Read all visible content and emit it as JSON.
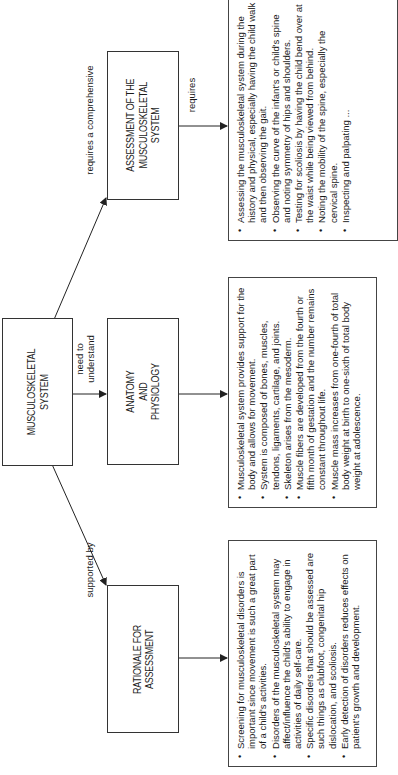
{
  "diagram": {
    "type": "concept-map",
    "orientation": "rotated-90-ccw",
    "nodes": {
      "root": {
        "label": "MUSCULOSKELETAL\nSYSTEM"
      },
      "assessment": {
        "label": "ASSESSMENT OF THE\nMUSCULOSKELETAL\nSYSTEM"
      },
      "anatomy": {
        "label": "ANATOMY\nAND\nPHYSIOLOGY"
      },
      "rationale": {
        "label": "RATIONALE FOR\nASSESSMENT"
      }
    },
    "edges": {
      "root_to_assessment": {
        "label": "requires a comprehensive"
      },
      "root_to_anatomy": {
        "label": "need to\nunderstand"
      },
      "root_to_rationale": {
        "label": "supported by"
      },
      "assessment_to_list": {
        "label": "requires"
      }
    },
    "lists": {
      "assessment": [
        {
          "text": "Assessing the musculoskeletal system during the history and physical, especially having the child walk and then observing the gait."
        },
        {
          "text": "Observing the curve of the infant's or child's spine and noting symmetry of hips and shoulders."
        },
        {
          "text": "Testing for scoliosis by having the child bend over at the waist while being viewed from behind."
        },
        {
          "text": "Noting the mobility of the spine, especially the cervical spine."
        },
        {
          "text": "Inspecting and palpating ..."
        }
      ],
      "anatomy": [
        {
          "text": "Musculoskeletal system provides support for the body and allows for movement."
        },
        {
          "text": "System is composed of bones, muscles, tendons, ligaments, cartilage, and joints."
        },
        {
          "text": "Skeleton arises from the mesoderm."
        },
        {
          "text": "Muscle fibers are developed from the fourth or fifth month of gestation and the number remains constant throughout life."
        },
        {
          "text": "Muscle mass increases from one-fourth of total body weight at birth to one-sixth of total body weight at adolescence."
        }
      ],
      "rationale": [
        {
          "text": "Screening for musculoskeletal disorders is important since movement is such a great part of a child's activities."
        },
        {
          "text": "Disorders of the musculoskeletal system may affect/influence the child's ability to engage in activities of daily self-care."
        },
        {
          "text": "Specific disorders that should be assessed are such things as clubfoot, congenital hip dislocation, and scoliosis."
        },
        {
          "text": "Early detection of disorders reduces effects on patient's growth and development."
        }
      ]
    },
    "bullet_glyph": "•",
    "colors": {
      "line": "#222222",
      "text": "#1a1a1a",
      "background": "#ffffff"
    }
  }
}
